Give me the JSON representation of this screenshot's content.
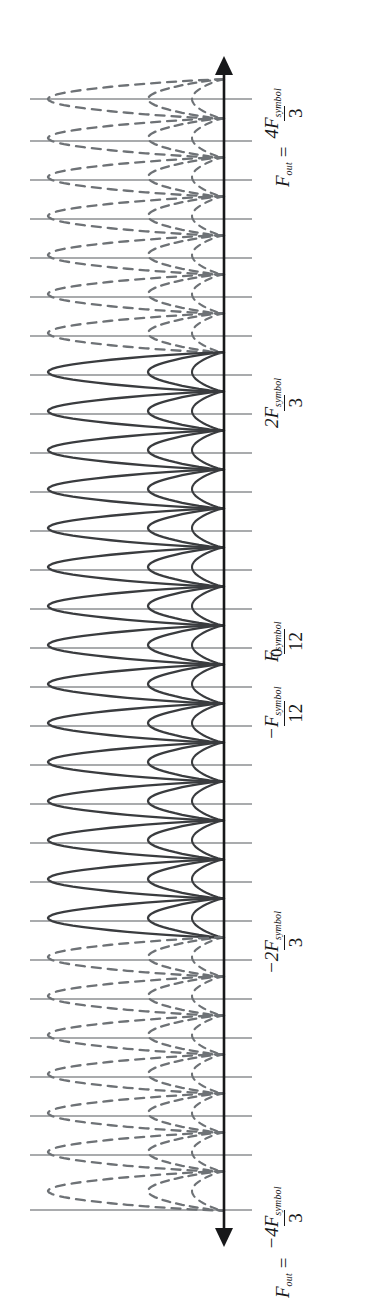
{
  "figure": {
    "title": "",
    "kind": "spectrum-plot",
    "orientation": "rotated-90-ccw",
    "axis": {
      "name": "frequency-axis",
      "double_headed": true,
      "color": "#17181a"
    },
    "colors": {
      "ink": "#17181a",
      "curve_solid": "#3a3c3f",
      "curve_dashed": "#6e7276",
      "gridline": "#55585c",
      "background": "#ffffff"
    },
    "labels": [
      {
        "id": "label-top",
        "name": "tick-label-4fsym-over-3",
        "lhs": "F",
        "lhs_sub": "out",
        "eq": "=",
        "numerator": "4F",
        "numerator_sub": "symbol",
        "denominator": "3",
        "text": "F_out = 4F_symbol / 3",
        "y": 99
      },
      {
        "id": "label-2fsym",
        "name": "tick-label-2fsym-over-3",
        "lhs": "",
        "lhs_sub": "",
        "eq": "",
        "numerator": "2F",
        "numerator_sub": "symbol",
        "denominator": "3",
        "text": "2F_symbol / 3",
        "y": 375
      },
      {
        "id": "label-pos-fsym12",
        "name": "tick-label-fsym-over-12",
        "lhs": "",
        "lhs_sub": "",
        "eq": "",
        "numerator": "F",
        "numerator_sub": "symbol",
        "denominator": "12",
        "text": "F_symbol / 12",
        "y": 609
      },
      {
        "id": "label-zero",
        "name": "tick-label-zero",
        "text": "0",
        "y": 648
      },
      {
        "id": "label-neg-fsym12",
        "name": "tick-label-neg-fsym-over-12",
        "lhs": "",
        "lhs_sub": "",
        "eq": "",
        "numerator": "−F",
        "numerator_sub": "symbol",
        "denominator": "12",
        "text": "-F_symbol / 12",
        "y": 687
      },
      {
        "id": "label-neg-2fsym",
        "name": "tick-label-neg-2fsym-over-3",
        "lhs": "",
        "lhs_sub": "",
        "eq": "",
        "numerator": "−2F",
        "numerator_sub": "symbol",
        "denominator": "3",
        "text": "-2F_symbol / 3",
        "y": 921
      },
      {
        "id": "label-bottom",
        "name": "tick-label-neg-4fsym-over-3",
        "lhs": "F",
        "lhs_sub": "out",
        "eq": "=",
        "numerator": "−4F",
        "numerator_sub": "symbol",
        "denominator": "3",
        "text": "F_out = -4F_symbol / 3",
        "y": 1210
      }
    ]
  },
  "chart_data": {
    "type": "line",
    "title": "",
    "xlabel": "",
    "ylabel": "",
    "orientation": "vertical-frequency-axis",
    "axis_range_px": [
      58,
      1245
    ],
    "axis_x_px": 224,
    "gridline_left_px": 30,
    "gridline_right_px": 252,
    "legend": [],
    "grid": true,
    "annotated_ticks": [
      {
        "label": "F_out = 4F_symbol/3",
        "y_px": 99,
        "value": 1.3333
      },
      {
        "label": "2F_symbol/3",
        "y_px": 375,
        "value": 0.6667
      },
      {
        "label": "F_symbol/12",
        "y_px": 609,
        "value": 0.0833
      },
      {
        "label": "0",
        "y_px": 648,
        "value": 0.0
      },
      {
        "label": "-F_symbol/12",
        "y_px": 687,
        "value": -0.0833
      },
      {
        "label": "-2F_symbol/3",
        "y_px": 921,
        "value": -0.6667
      },
      {
        "label": "F_out = -4F_symbol/3",
        "y_px": 1210,
        "value": -1.3333
      }
    ],
    "gridlines_y_px": [
      99,
      141,
      180,
      219,
      258,
      297,
      336,
      375,
      414,
      453,
      492,
      531,
      570,
      609,
      648,
      687,
      726,
      765,
      804,
      843,
      882,
      921,
      960,
      999,
      1038,
      1077,
      1116,
      1155,
      1210
    ],
    "series": [
      {
        "name": "wide-lobes",
        "style": "sinc-main-lobes",
        "count": 29,
        "spacing_px": 39,
        "first_center_y_px": 99,
        "peak_x_px": 48,
        "baseline_x_px": 224,
        "solid_range_px": [
          370,
          925
        ],
        "dash_pattern": "9 7"
      },
      {
        "name": "narrow-lobes",
        "style": "sinc-side-lobes",
        "count": 29,
        "spacing_px": 39,
        "first_center_y_px": 99,
        "peak_x_px": 148,
        "baseline_x_px": 224,
        "solid_range_px": [
          370,
          925
        ],
        "dash_pattern": "8 6"
      },
      {
        "name": "narrowest-lobes",
        "style": "sinc-outer-side-lobes",
        "count": 29,
        "spacing_px": 39,
        "first_center_y_px": 99,
        "peak_x_px": 192,
        "baseline_x_px": 224,
        "solid_range_px": [
          370,
          925
        ],
        "dash_pattern": "7 6"
      }
    ]
  }
}
